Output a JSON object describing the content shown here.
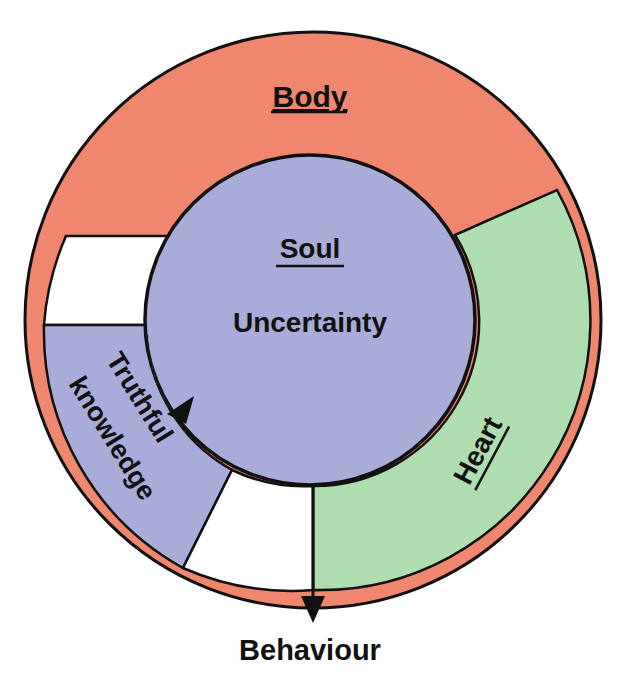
{
  "diagram": {
    "type": "concentric-circle-diagram",
    "labels": {
      "body": "Body",
      "soul": "Soul",
      "uncertainty": "Uncertainty",
      "heart": "Heart",
      "truthful_knowledge_line1": "Truthful",
      "truthful_knowledge_line2": "knowledge",
      "behaviour": "Behaviour"
    },
    "colors": {
      "body": "#F0866E",
      "soul": "#A9ABD8",
      "heart": "#AEDDAF",
      "truthful_knowledge": "#A9ABD8",
      "gap": "#FFFFFF",
      "outline": "#111111"
    },
    "regions": [
      {
        "name": "Body",
        "role": "outer ring and top region",
        "underlined": true
      },
      {
        "name": "Soul",
        "role": "central circle",
        "underlined": true
      },
      {
        "name": "Heart",
        "role": "right sector",
        "underlined": true
      },
      {
        "name": "Truthful knowledge",
        "role": "lower-left sector",
        "underlined": false
      }
    ],
    "arrows": [
      {
        "from": "Truthful knowledge",
        "to": "Soul",
        "style": "dotted-with-arrowhead"
      },
      {
        "from": "Heart",
        "to": "Behaviour",
        "style": "solid-with-arrowhead"
      }
    ]
  }
}
